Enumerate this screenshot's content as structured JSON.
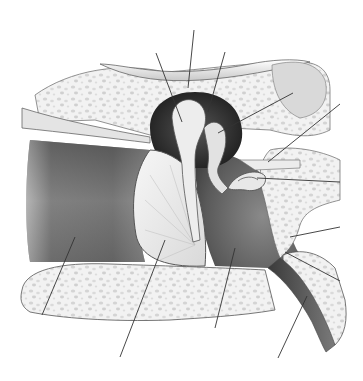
{
  "diagram": {
    "labels_visible": false,
    "width": 363,
    "height": 381,
    "colors": {
      "background": "#ffffff",
      "bone_fill": "#f1f1f1",
      "bone_spot": "#d6d6d6",
      "canal_dark": "#5a5a5a",
      "canal_mid": "#9a9a9a",
      "cavity_dark": "#2e2e2e",
      "cavity_mid": "#6e6e6e",
      "membrane": "#ececec",
      "ossicle": "#e6e6e6",
      "outline": "#555555",
      "leader_line": "#333333"
    },
    "leader_lines": [
      {
        "id": "line-1",
        "x1": 156,
        "y1": 53,
        "x2": 182,
        "y2": 122
      },
      {
        "id": "line-2",
        "x1": 194,
        "y1": 30,
        "x2": 188,
        "y2": 88
      },
      {
        "id": "line-3",
        "x1": 225,
        "y1": 52,
        "x2": 208,
        "y2": 112
      },
      {
        "id": "line-4",
        "x1": 293,
        "y1": 93,
        "x2": 218,
        "y2": 133
      },
      {
        "id": "line-5",
        "x1": 340,
        "y1": 104,
        "x2": 268,
        "y2": 162
      },
      {
        "id": "line-6",
        "x1": 340,
        "y1": 182,
        "x2": 257,
        "y2": 178
      },
      {
        "id": "line-7",
        "x1": 340,
        "y1": 227,
        "x2": 290,
        "y2": 237
      },
      {
        "id": "line-8",
        "x1": 340,
        "y1": 281,
        "x2": 285,
        "y2": 252
      },
      {
        "id": "line-9",
        "x1": 307,
        "y1": 296,
        "x2": 278,
        "y2": 358
      },
      {
        "id": "line-10",
        "x1": 235,
        "y1": 248,
        "x2": 215,
        "y2": 328
      },
      {
        "id": "line-11",
        "x1": 165,
        "y1": 240,
        "x2": 120,
        "y2": 357
      },
      {
        "id": "line-12",
        "x1": 75,
        "y1": 237,
        "x2": 42,
        "y2": 315
      }
    ]
  }
}
